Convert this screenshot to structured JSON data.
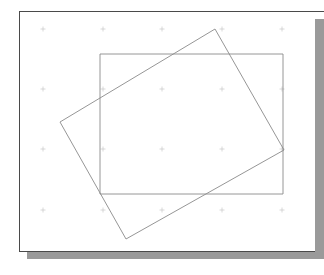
{
  "app": {
    "title": "Drawing Canvas",
    "background_color": "#ffffff"
  },
  "canvas": {
    "name": "drawing-page",
    "page_color": "#ffffff",
    "border_color": "#4a4a4a",
    "shadow_color": "#9a9a9a",
    "x": 19,
    "y": 11,
    "width": 296,
    "height": 241
  },
  "grid": {
    "marker_type": "cross",
    "marker_color": "#c9c9c9",
    "spacing_x": 60,
    "spacing_y": 60,
    "marker_size": 5,
    "origin_x": 43,
    "origin_y": 29,
    "columns": 5,
    "rows": 4,
    "points": [
      {
        "x": 43,
        "y": 29
      },
      {
        "x": 103,
        "y": 29
      },
      {
        "x": 162,
        "y": 29
      },
      {
        "x": 222,
        "y": 29
      },
      {
        "x": 282,
        "y": 29
      },
      {
        "x": 43,
        "y": 89
      },
      {
        "x": 103,
        "y": 89
      },
      {
        "x": 162,
        "y": 89
      },
      {
        "x": 222,
        "y": 89
      },
      {
        "x": 282,
        "y": 89
      },
      {
        "x": 43,
        "y": 149
      },
      {
        "x": 103,
        "y": 149
      },
      {
        "x": 162,
        "y": 149
      },
      {
        "x": 222,
        "y": 149
      },
      {
        "x": 282,
        "y": 149
      },
      {
        "x": 43,
        "y": 210
      },
      {
        "x": 103,
        "y": 210
      },
      {
        "x": 162,
        "y": 210
      },
      {
        "x": 222,
        "y": 210
      },
      {
        "x": 282,
        "y": 210
      }
    ]
  },
  "shapes": {
    "stroke_color": "#8a8a8a",
    "stroke_width": 0.9,
    "fill": "none",
    "items": [
      {
        "name": "axis-aligned-rectangle",
        "type": "rectangle",
        "rotation_deg": 0,
        "x": 100,
        "y": 54,
        "width": 183,
        "height": 140,
        "points": "100,54 283,54 283,194 100,194"
      },
      {
        "name": "rotated-rectangle",
        "type": "rectangle",
        "rotation_deg": 22,
        "points": "215,29 284,150 126,239 60,122",
        "vertices": [
          {
            "label": "top",
            "x": 215,
            "y": 29
          },
          {
            "label": "right",
            "x": 284,
            "y": 150
          },
          {
            "label": "bottom",
            "x": 126,
            "y": 239
          },
          {
            "label": "left",
            "x": 60,
            "y": 122
          }
        ]
      }
    ]
  }
}
